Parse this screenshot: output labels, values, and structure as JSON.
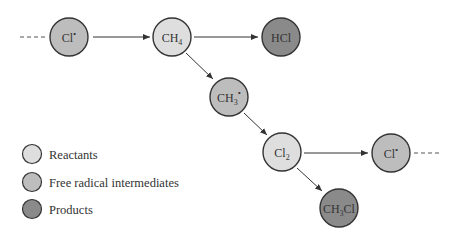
{
  "colors": {
    "reactant": "#dedede",
    "intermediate": "#bdbdbd",
    "product": "#8a8a8a",
    "stroke": "#333333"
  },
  "nodes": [
    {
      "id": "cl-radical-1",
      "label": "Cl",
      "sup": "•",
      "sub": "",
      "type": "intermediate"
    },
    {
      "id": "ch4",
      "label": "CH",
      "sup": "",
      "sub": "4",
      "type": "reactant"
    },
    {
      "id": "hcl",
      "label": "HCl",
      "sup": "",
      "sub": "",
      "type": "product"
    },
    {
      "id": "ch3-radical",
      "label": "CH",
      "sup": "•",
      "sub": "3",
      "type": "intermediate"
    },
    {
      "id": "cl2",
      "label": "Cl",
      "sup": "",
      "sub": "2",
      "type": "reactant"
    },
    {
      "id": "cl-radical-2",
      "label": "Cl",
      "sup": "•",
      "sub": "",
      "type": "intermediate"
    },
    {
      "id": "ch3cl",
      "label": "CH",
      "sub": "3",
      "tail": "Cl",
      "sup": "",
      "type": "product"
    }
  ],
  "legend": [
    {
      "label": "Reactants",
      "type": "reactant"
    },
    {
      "label": "Free radical intermediates",
      "type": "intermediate"
    },
    {
      "label": "Products",
      "type": "product"
    }
  ]
}
